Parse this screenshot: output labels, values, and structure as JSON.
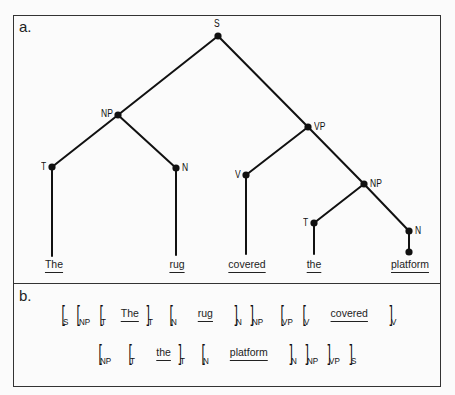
{
  "panel_a": {
    "label": "a.",
    "nodes": {
      "s": "S",
      "np": "NP",
      "t": "T",
      "n": "N",
      "vp": "VP",
      "v": "V",
      "np2": "NP",
      "t2": "T",
      "n2": "N"
    },
    "leaves": [
      "The",
      "rug",
      "covered",
      "the",
      "platform"
    ]
  },
  "panel_b": {
    "label": "b.",
    "line1": {
      "b1": "[",
      "s1": "S",
      "b2": "[",
      "s2": "NP",
      "b3": "[",
      "s3": "T",
      "w1": "The",
      "b4": "]",
      "s4": "T",
      "b5": "[",
      "s5": "N",
      "w2": "rug",
      "b6": "]",
      "s6": "N",
      "b7": "]",
      "s7": "NP",
      "b8": "[",
      "s8": "VP",
      "b9": "[",
      "s9": "V",
      "w3": "covered",
      "b10": "]",
      "s10": "V"
    },
    "line2": {
      "b1": "[",
      "s1": "NP",
      "b2": "[",
      "s2": "T",
      "w1": "the",
      "b3": "]",
      "s3": "T",
      "b4": "[",
      "s4": "N",
      "w2": "platform",
      "b5": "]",
      "s5": "N",
      "b6": "]",
      "s6": "NP",
      "b7": "]",
      "s7": "VP",
      "b8": "]",
      "s8": "S"
    }
  }
}
